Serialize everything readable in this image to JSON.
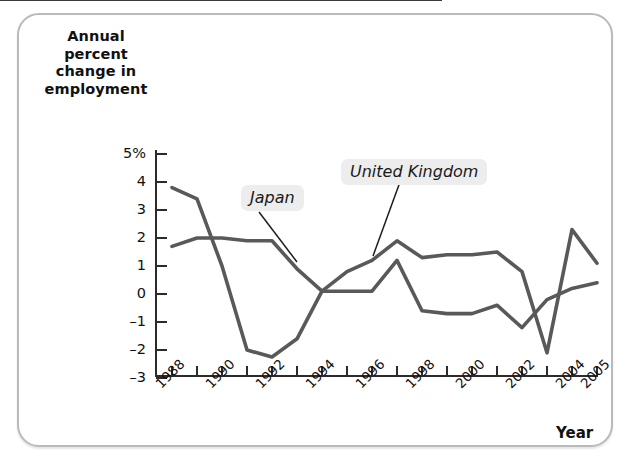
{
  "figure": {
    "y_axis_title": "Annual percent change in employment",
    "x_axis_title": "Year"
  },
  "labels": {
    "japan": "Japan",
    "united_kingdom": "United Kingdom"
  },
  "colors": {
    "line": "#595959",
    "axis": "#2b2b2b",
    "frame_border": "#b9babc",
    "label_background": "#ededed",
    "background": "#ffffff"
  },
  "chart_data": {
    "type": "line",
    "title": "",
    "xlabel": "Year",
    "ylabel": "Annual percent change in employment",
    "xlim": [
      1988,
      2005
    ],
    "ylim": [
      -3,
      5
    ],
    "ytick_labels": [
      "5%",
      "4",
      "3",
      "2",
      "1",
      "0",
      "-1",
      "-2",
      "-3"
    ],
    "ytick_values": [
      5,
      4,
      3,
      2,
      1,
      0,
      -1,
      -2,
      -3
    ],
    "xtick_labels": [
      "1988",
      "1990",
      "1992",
      "1994",
      "1996",
      "1998",
      "2000",
      "2002",
      "2004",
      "2005"
    ],
    "xtick_values": [
      1988,
      1990,
      1992,
      1994,
      1996,
      1998,
      2000,
      2002,
      2004,
      2005
    ],
    "grid": false,
    "legend_position": "inline-annotations",
    "x": [
      1988,
      1989,
      1990,
      1991,
      1992,
      1993,
      1994,
      1995,
      1996,
      1997,
      1998,
      1999,
      2000,
      2001,
      2002,
      2003,
      2004,
      2005
    ],
    "series": [
      {
        "name": "United Kingdom",
        "values": [
          3.8,
          3.4,
          1.0,
          -2.0,
          -2.25,
          -1.6,
          0.1,
          0.8,
          1.2,
          1.9,
          1.3,
          1.4,
          1.4,
          1.5,
          0.8,
          -2.1,
          2.3,
          1.1
        ]
      },
      {
        "name": "Japan",
        "values": [
          1.7,
          2.0,
          2.0,
          1.9,
          1.9,
          0.9,
          0.1,
          0.1,
          0.1,
          1.2,
          -0.6,
          -0.7,
          -0.7,
          -0.4,
          -1.2,
          -0.2,
          0.2,
          0.4
        ]
      }
    ],
    "annotations": [
      {
        "text": "Japan",
        "points_to_year": 1995
      },
      {
        "text": "United Kingdom",
        "points_to_year": 1998
      }
    ]
  }
}
